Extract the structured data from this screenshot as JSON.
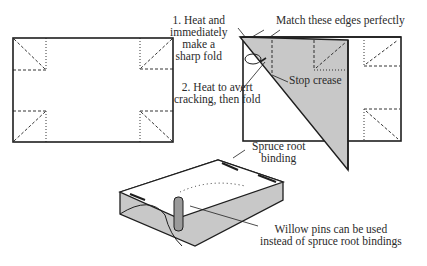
{
  "labels": {
    "step1": [
      "1. Heat and",
      "immediately",
      "make a",
      "sharp fold"
    ],
    "step2": [
      "2. Heat to avert",
      "cracking, then fold"
    ],
    "match_edges": "Match these edges perfectly",
    "stop_crease": "Stop crease",
    "spruce_root": [
      "Spruce root",
      "binding"
    ],
    "willow_pins": [
      "Willow pins can be used",
      "instead of spruce root bindings"
    ]
  },
  "colors": {
    "ink": "#1e1e1e",
    "fill_gray": "#c8c8c8",
    "background": "#ffffff"
  }
}
